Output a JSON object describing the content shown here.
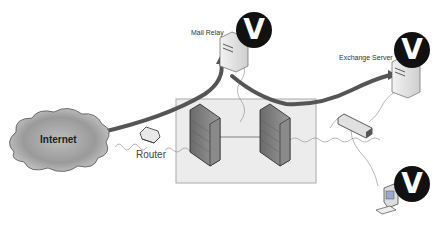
{
  "diagram": {
    "nodes": {
      "internet": {
        "label": "Internet"
      },
      "router": {
        "label": "Router"
      },
      "mail_relay": {
        "label": "Mail Relay",
        "badge": "V"
      },
      "exchange_server": {
        "label": "Exchange Server",
        "badge": "V"
      },
      "workstation": {
        "label": "",
        "badge": "V"
      },
      "firewall_left": {
        "label": ""
      },
      "firewall_right": {
        "label": ""
      },
      "switch": {
        "label": ""
      }
    },
    "zones": {
      "dmz": {
        "label": ""
      }
    },
    "flows": [
      {
        "from": "internet",
        "to": "mail_relay"
      },
      {
        "from": "mail_relay",
        "to": "exchange_server"
      }
    ],
    "caption": "Addition ... (cut off)"
  },
  "colors": {
    "arrow": "#555555",
    "dmz_fill": "#ececec",
    "dmz_stroke": "#aaaaaa",
    "badge": "#111111"
  }
}
